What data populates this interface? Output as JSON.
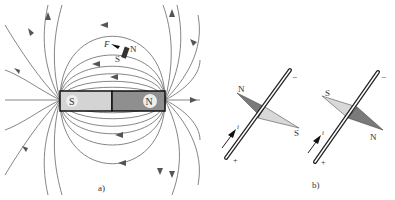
{
  "figure_a": {
    "caption": "a)",
    "magnet": {
      "south_label": "S",
      "north_label": "N",
      "south_color": "#d4d4d4",
      "north_color": "#8f8f8f"
    },
    "compass": {
      "force_label": "F",
      "north_label": "N",
      "south_label": "S"
    },
    "field_line_color": "#555555"
  },
  "figure_b": {
    "caption": "b)",
    "left": {
      "needle_north_label": "N",
      "needle_south_label": "S",
      "current_label": "i",
      "top_terminal": "−",
      "bottom_terminal": "+"
    },
    "right": {
      "needle_north_label": "N",
      "needle_south_label": "S",
      "current_label": "i",
      "top_terminal": "−",
      "bottom_terminal": "+"
    },
    "dark_color": "#7a7a7a",
    "light_color": "#d8d8d8"
  }
}
